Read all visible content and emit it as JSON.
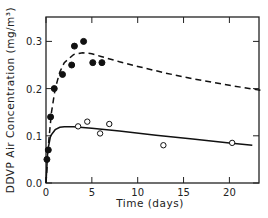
{
  "chart_data": {
    "type": "scatter",
    "title": "",
    "xlabel": "Time (days)",
    "ylabel": "DDVP Air Concentration (mg/m³)",
    "xlim": [
      0,
      23.5
    ],
    "ylim": [
      0,
      0.35
    ],
    "xticks": [
      0,
      5,
      10,
      15,
      20
    ],
    "xtick_labels": [
      "0",
      "5",
      "10",
      "15",
      "20"
    ],
    "yticks": [
      0.0,
      0.1,
      0.2,
      0.3
    ],
    "ytick_labels": [
      "0.0",
      "0.1",
      "0.2",
      "0.3"
    ],
    "grid": false,
    "legend": null,
    "series": [
      {
        "name": "filled circles (observed, higher dose)",
        "marker": "filled-circle",
        "x": [
          0.1,
          0.25,
          0.5,
          0.9,
          1.8,
          2.8,
          3.1,
          4.1,
          5.1,
          6.1
        ],
        "y": [
          0.05,
          0.07,
          0.14,
          0.2,
          0.23,
          0.25,
          0.29,
          0.3,
          0.255,
          0.255
        ]
      },
      {
        "name": "open circles (observed, lower dose)",
        "marker": "open-circle",
        "x": [
          3.5,
          4.5,
          5.9,
          6.9,
          12.8,
          20.3
        ],
        "y": [
          0.12,
          0.13,
          0.105,
          0.125,
          0.08,
          0.085
        ]
      },
      {
        "name": "dashed model curve",
        "style": "dashed",
        "x": [
          0,
          0.3,
          0.6,
          1.0,
          1.5,
          2.0,
          3.0,
          4.0,
          5.0,
          6.0,
          8.0,
          10.0,
          13.0,
          16.0,
          20.0,
          23.5
        ],
        "y": [
          0,
          0.09,
          0.15,
          0.2,
          0.235,
          0.255,
          0.272,
          0.276,
          0.274,
          0.268,
          0.257,
          0.247,
          0.233,
          0.221,
          0.207,
          0.196
        ]
      },
      {
        "name": "solid model curve",
        "style": "solid",
        "x": [
          0,
          0.2,
          0.5,
          1.0,
          1.5,
          2.0,
          3.0,
          5.0,
          8.0,
          12.0,
          16.0,
          20.0,
          22.5
        ],
        "y": [
          0,
          0.07,
          0.1,
          0.113,
          0.118,
          0.119,
          0.119,
          0.116,
          0.11,
          0.101,
          0.093,
          0.085,
          0.08
        ]
      }
    ]
  }
}
